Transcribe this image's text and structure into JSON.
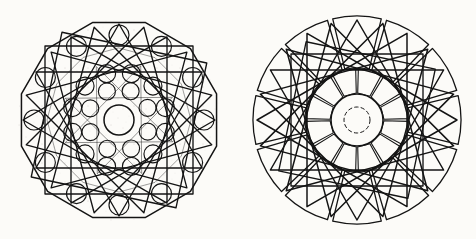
{
  "plate": {
    "title": "Two geometric rosette construction diagrams",
    "background_color": "#fcfbf8",
    "ink_color": "#1a1a1a",
    "medium": "scanned line drawing on aged paper",
    "figure_count": 2
  },
  "figures": [
    {
      "id": "left-rosette",
      "name": "Dodecagonal rosette with circle grid",
      "center": {
        "x": 119,
        "y": 120
      },
      "outer_radius": 101,
      "boundary": {
        "shape": "polygon",
        "sides": 12,
        "rotation_deg": 15
      },
      "overlays": [
        {
          "name": "square-a",
          "shape": "square",
          "half_size": 74,
          "rotation_deg": 0
        },
        {
          "name": "square-b",
          "shape": "square",
          "half_size": 74,
          "rotation_deg": 12
        },
        {
          "name": "star-12-4",
          "shape": "star-polygon",
          "points": 12,
          "step": 4,
          "radius": 96,
          "rotation_deg": 0
        },
        {
          "name": "star-12-4-b",
          "shape": "star-polygon",
          "points": 12,
          "step": 4,
          "radius": 96,
          "rotation_deg": 15
        },
        {
          "name": "inner-decagon",
          "shape": "polygon",
          "sides": 12,
          "radius": 72,
          "rotation_deg": 0
        },
        {
          "name": "inner-star-8",
          "shape": "star-polygon",
          "points": 8,
          "step": 3,
          "radius": 58,
          "rotation_deg": 22
        }
      ],
      "circle_rings": [
        {
          "name": "center-circle",
          "count": 1,
          "ring_radius": 0,
          "circle_radius": 15
        },
        {
          "name": "inner-ring",
          "count": 8,
          "ring_radius": 31,
          "circle_radius": 8.5,
          "phase_deg": 22
        },
        {
          "name": "mid-ring",
          "count": 12,
          "ring_radius": 48,
          "circle_radius": 9,
          "phase_deg": 15
        },
        {
          "name": "outer-lobe-ring",
          "count": 12,
          "ring_radius": 85,
          "circle_radius": 10,
          "phase_deg": 0
        }
      ]
    },
    {
      "id": "right-rosette",
      "name": "Twelve-sector rosette with star overlay",
      "center": {
        "x": 357,
        "y": 120
      },
      "outer_radius": 105,
      "boundary": {
        "shape": "circle-of-sectors",
        "sectors": 12
      },
      "sector_ring": {
        "count": 12,
        "inner_radius": 52,
        "outer_radius": 104,
        "gap_deg": 3,
        "span_deg": 27
      },
      "inner_sector_ring": {
        "count": 12,
        "inner_radius": 27,
        "outer_radius": 52,
        "gap_deg": 3
      },
      "overlays": [
        {
          "name": "square-a",
          "shape": "square",
          "half_size": 66,
          "rotation_deg": 0
        },
        {
          "name": "square-b",
          "shape": "square",
          "half_size": 66,
          "rotation_deg": 12
        },
        {
          "name": "star-12-4",
          "shape": "star-polygon",
          "points": 12,
          "step": 4,
          "radius": 100,
          "rotation_deg": 0
        },
        {
          "name": "star-12-4-b",
          "shape": "star-polygon",
          "points": 12,
          "step": 4,
          "radius": 100,
          "rotation_deg": 15
        }
      ],
      "circles": [
        {
          "name": "center-circle",
          "radius": 26,
          "style": "solid"
        },
        {
          "name": "center-inner-circle",
          "radius": 13,
          "style": "dashed"
        }
      ]
    }
  ]
}
